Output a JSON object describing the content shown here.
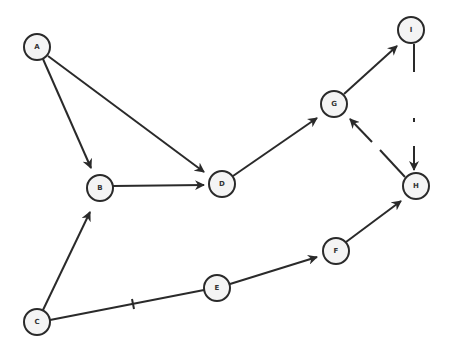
{
  "diagram": {
    "type": "directed-graph",
    "nodes": [
      {
        "id": "A",
        "label": "A",
        "x": 37,
        "y": 47
      },
      {
        "id": "B",
        "label": "B",
        "x": 100,
        "y": 188
      },
      {
        "id": "D",
        "label": "D",
        "x": 222,
        "y": 184
      },
      {
        "id": "G",
        "label": "G",
        "x": 334,
        "y": 104
      },
      {
        "id": "I",
        "label": "I",
        "x": 411,
        "y": 30
      },
      {
        "id": "H",
        "label": "H",
        "x": 416,
        "y": 186
      },
      {
        "id": "F",
        "label": "F",
        "x": 336,
        "y": 251
      },
      {
        "id": "E",
        "label": "E",
        "x": 217,
        "y": 288
      },
      {
        "id": "C",
        "label": "C",
        "x": 37,
        "y": 322
      }
    ],
    "edges": [
      {
        "from": "A",
        "to": "B",
        "directed": true
      },
      {
        "from": "A",
        "to": "D",
        "directed": true
      },
      {
        "from": "B",
        "to": "D",
        "directed": true
      },
      {
        "from": "C",
        "to": "B",
        "directed": true
      },
      {
        "from": "C",
        "to": "E",
        "directed": false,
        "marked": true
      },
      {
        "from": "E",
        "to": "F",
        "directed": true
      },
      {
        "from": "F",
        "to": "H",
        "directed": true
      },
      {
        "from": "D",
        "to": "G",
        "directed": true
      },
      {
        "from": "G",
        "to": "I",
        "directed": true
      },
      {
        "from": "I",
        "to": "H",
        "directed": true,
        "style": "faded"
      },
      {
        "from": "H",
        "to": "G",
        "directed": true,
        "style": "faded"
      }
    ]
  }
}
